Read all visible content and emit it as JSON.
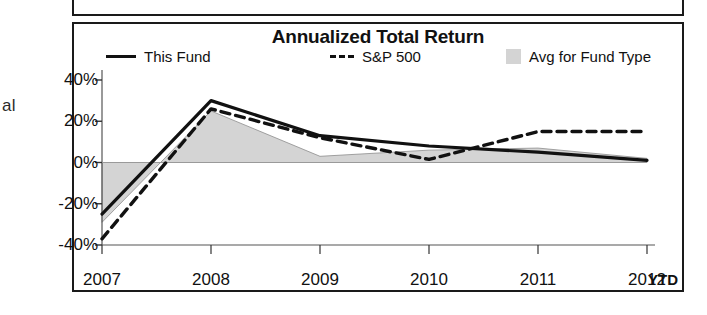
{
  "fragments": {
    "left_text": "al"
  },
  "chart_panel": {
    "title": "Annualized Total Return",
    "legend": [
      {
        "label": "This Fund",
        "marker": "solid-line"
      },
      {
        "label": "S&P 500",
        "marker": "dashed-line"
      },
      {
        "label": "Avg for Fund Type",
        "marker": "shaded-area"
      }
    ],
    "axis_note": "YTD"
  },
  "chart_data": {
    "type": "line",
    "title": "Annualized Total Return",
    "xlabel": "",
    "ylabel": "",
    "categories": [
      "2007",
      "2008",
      "2009",
      "2010",
      "2011",
      "2012"
    ],
    "ytick_labels": [
      "40%",
      "20%",
      "0%",
      "-20%",
      "-40%"
    ],
    "yticks": [
      40,
      20,
      0,
      -20,
      -40
    ],
    "ylim": [
      -40,
      40
    ],
    "grid": false,
    "legend_position": "top",
    "annotations": [
      "YTD"
    ],
    "series": [
      {
        "name": "This Fund",
        "style": "solid",
        "color": "#111111",
        "values": [
          -25,
          30,
          13,
          8,
          5,
          1
        ]
      },
      {
        "name": "S&P 500",
        "style": "dashed",
        "color": "#111111",
        "values": [
          -37,
          26,
          12,
          1.5,
          15,
          15
        ]
      },
      {
        "name": "Avg for Fund Type",
        "style": "area",
        "color": "#d4d4d4",
        "values": [
          -29,
          25,
          3,
          6,
          7,
          2
        ]
      }
    ]
  }
}
